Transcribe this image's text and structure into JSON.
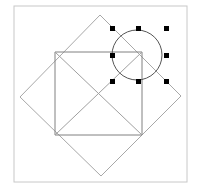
{
  "canvas": {
    "width": 199,
    "height": 190,
    "background_color": "#ffffff",
    "title": "Geometry Canvas"
  },
  "frame": {
    "name": "drawing-frame-border",
    "x": 14,
    "y": 6,
    "width": 173,
    "height": 176,
    "stroke_color": "#c8c8c8",
    "stroke_width": 1,
    "fill": "none"
  },
  "shapes": {
    "diamond": {
      "label": "rotated-square",
      "points": "100,15 181,96 101,176 20,97",
      "vertices": [
        {
          "name": "top",
          "x": 100,
          "y": 15
        },
        {
          "name": "right",
          "x": 181,
          "y": 96
        },
        {
          "name": "bottom",
          "x": 101,
          "y": 176
        },
        {
          "name": "left",
          "x": 20,
          "y": 97
        }
      ],
      "stroke_color": "#a8a8a8",
      "stroke_width": 1,
      "fill": "none"
    },
    "square": {
      "label": "upright-square",
      "x": 55,
      "y": 52,
      "width": 87,
      "height": 83,
      "points": "55,52 142,52 142,135 55,135",
      "stroke_color": "#808080",
      "stroke_width": 1,
      "fill": "none"
    },
    "diagonals": {
      "label": "square-diagonals",
      "lines": [
        {
          "name": "diagonal-tl-br",
          "x1": 55,
          "y1": 52,
          "x2": 142,
          "y2": 135
        },
        {
          "name": "diagonal-bl-tr",
          "x1": 55,
          "y1": 135,
          "x2": 142,
          "y2": 52
        }
      ],
      "stroke_color": "#a0a0a0",
      "stroke_width": 1
    },
    "circle": {
      "label": "selected-circle",
      "cx": 137,
      "cy": 55,
      "r": 25,
      "stroke_color": "#555555",
      "stroke_width": 1,
      "fill": "none",
      "selected": true
    }
  },
  "selection": {
    "label": "circle-selection-handles",
    "handle_color": "#000000",
    "handle_size": 5,
    "handles": [
      {
        "name": "handle-top-left",
        "x": 110,
        "y": 26
      },
      {
        "name": "handle-top-center",
        "x": 136,
        "y": 26
      },
      {
        "name": "handle-top-right",
        "x": 164,
        "y": 26
      },
      {
        "name": "handle-middle-left",
        "x": 110,
        "y": 53
      },
      {
        "name": "handle-middle-right",
        "x": 164,
        "y": 53
      },
      {
        "name": "handle-bottom-left",
        "x": 110,
        "y": 79
      },
      {
        "name": "handle-bottom-center",
        "x": 136,
        "y": 79
      },
      {
        "name": "handle-bottom-right",
        "x": 164,
        "y": 79
      }
    ]
  }
}
